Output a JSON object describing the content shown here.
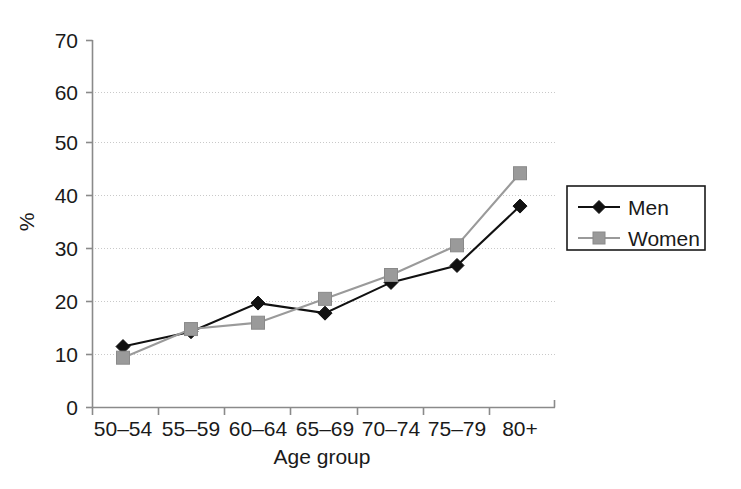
{
  "chart_data": {
    "type": "line",
    "title": "",
    "xlabel": "Age group",
    "ylabel": "%",
    "categories": [
      "50–54",
      "55–59",
      "60–64",
      "65–69",
      "70–74",
      "75–79",
      "80+"
    ],
    "series": [
      {
        "name": "Men",
        "values": [
          11.5,
          14.3,
          19.7,
          17.8,
          23.6,
          26.8,
          38.0
        ],
        "color": "#111111",
        "marker": "diamond",
        "linestyle": "solid"
      },
      {
        "name": "Women",
        "values": [
          9.4,
          14.8,
          16.0,
          20.5,
          25.0,
          30.6,
          44.2
        ],
        "color": "#9a9a9a",
        "marker": "square",
        "linestyle": "solid"
      }
    ],
    "ylim": [
      0,
      70
    ],
    "yticks": [
      0,
      10,
      20,
      30,
      40,
      50,
      60,
      70
    ],
    "ytick_labels": [
      "0",
      "10",
      "20",
      "30",
      "40",
      "50",
      "60",
      "70"
    ],
    "grid": true,
    "grid_axis": "y",
    "legend_position": "right-outside",
    "legend_entries": [
      "Men",
      "Women"
    ]
  },
  "axes": {
    "y_axis_title": "%",
    "x_axis_title": "Age group"
  },
  "legend": {
    "items": [
      {
        "label": "Men"
      },
      {
        "label": "Women"
      }
    ]
  }
}
